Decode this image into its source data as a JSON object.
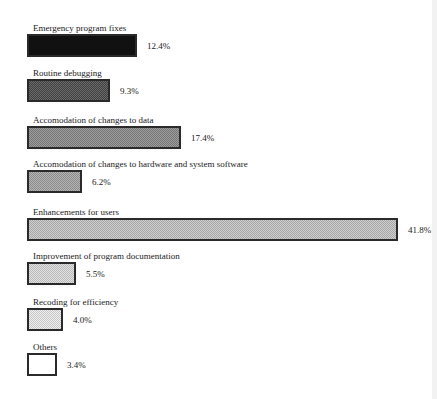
{
  "chart_data": {
    "type": "bar",
    "orientation": "horizontal",
    "title": "",
    "xlabel": "",
    "ylabel": "",
    "grid": false,
    "legend": null,
    "categories": [
      "Emergency program fixes",
      "Routine debugging",
      "Accomodation of changes to data",
      "Accomodation of changes to hardware and system software",
      "Enhancements for users",
      "Improvement of program documentation",
      "Recoding for efficiency",
      "Others"
    ],
    "values": [
      12.4,
      9.3,
      17.4,
      6.2,
      41.8,
      5.5,
      4.0,
      3.4
    ],
    "value_labels": [
      "12.4%",
      "9.3%",
      "17.4%",
      "6.2%",
      "41.8%",
      "5.5%",
      "4.0%",
      "3.4%"
    ],
    "unit": "%",
    "fills": [
      "#111111",
      "#4d4d4d",
      "#8c8c8c",
      "#a6a6a6",
      "#c6c6c6",
      "#dcdcdc",
      "#ececec",
      "#ffffff"
    ]
  }
}
